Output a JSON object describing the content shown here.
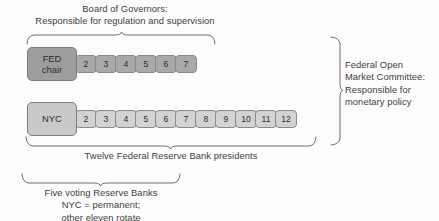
{
  "diagram": {
    "colors": {
      "fed_chair_fill": "#9d9d9d",
      "fed_number_fill": "#a9a9a9",
      "nyc_fill": "#c9c9c9",
      "nyc_number_fill": "#d3d3d3",
      "box_border": "#8a8a8a",
      "brace_stroke": "#6f6f6f",
      "text": "#3d3d3d",
      "background": "#fdfdfd"
    }
  },
  "captions": {
    "board_of_governors": "Board of Governors:\nResponsible for regulation and supervision",
    "fomc": "Federal Open\nMarket Committee:\nResponsible for\nmonetary policy",
    "twelve_presidents": "Twelve Federal Reserve Bank presidents",
    "five_voting": "Five voting Reserve Banks\nNYC = permanent;\nother eleven rotate"
  },
  "rows": {
    "board": {
      "lead_label": "FED\nchair",
      "lead_line1": "FED",
      "lead_line2": "chair",
      "numbers": [
        "2",
        "3",
        "4",
        "5",
        "6",
        "7"
      ]
    },
    "presidents": {
      "lead_label": "NYC",
      "numbers": [
        "2",
        "3",
        "4",
        "5",
        "6",
        "7",
        "8",
        "9",
        "10",
        "11",
        "12"
      ]
    }
  }
}
